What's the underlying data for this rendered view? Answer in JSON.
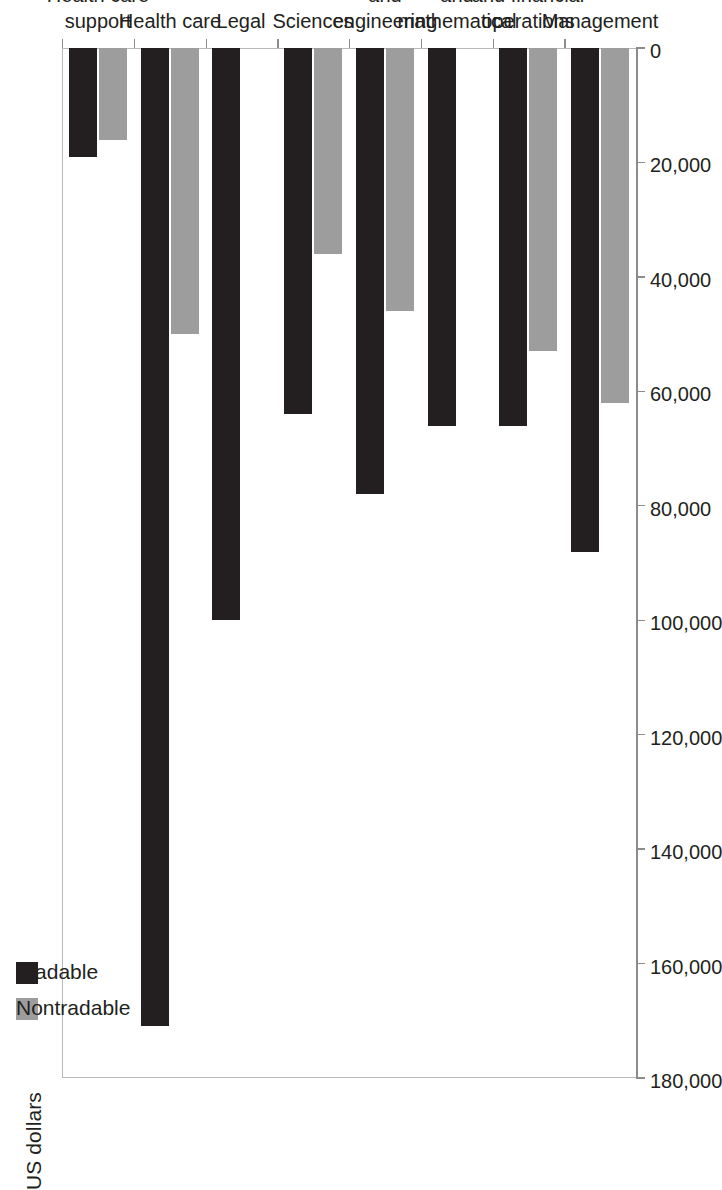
{
  "chart_data": {
    "type": "bar",
    "orientation": "horizontal",
    "title": "",
    "xlabel": "",
    "ylabel": "US dollars",
    "axis_title": "US dollars",
    "categories": [
      "Management",
      "Business and financial operations",
      "Computer and mathematical",
      "Architecture and engineering",
      "Sciences",
      "Legal",
      "Health care",
      "Health care support"
    ],
    "category_lines": [
      [
        "Management"
      ],
      [
        "Business",
        "and financial",
        "operations"
      ],
      [
        "Computer",
        "and",
        "mathematical"
      ],
      [
        "Architecture",
        "and",
        "engineering"
      ],
      [
        "Sciences"
      ],
      [
        "Legal"
      ],
      [
        "Health care"
      ],
      [
        "Health care",
        "support"
      ]
    ],
    "series": [
      {
        "name": "Nontradable",
        "color": "#9d9d9d",
        "values": [
          62000,
          53000,
          null,
          46000,
          36000,
          null,
          50000,
          16000
        ]
      },
      {
        "name": "Tradable",
        "color": "#231f20",
        "values": [
          88000,
          66000,
          66000,
          78000,
          64000,
          100000,
          171000,
          19000
        ]
      }
    ],
    "ticks": [
      0,
      20000,
      40000,
      60000,
      80000,
      100000,
      120000,
      140000,
      160000,
      180000
    ],
    "tick_labels": [
      "0",
      "20,000",
      "40,000",
      "60,000",
      "80,000",
      "100,000",
      "120,000",
      "140,000",
      "160,000",
      "180,000"
    ],
    "axis_range": [
      0,
      180000
    ],
    "grid": false,
    "legend_position": "top-left"
  },
  "legend": {
    "entries": [
      {
        "label": "Nontradable",
        "color": "#9d9d9d"
      },
      {
        "label": "Tradable",
        "color": "#231f20"
      }
    ]
  }
}
